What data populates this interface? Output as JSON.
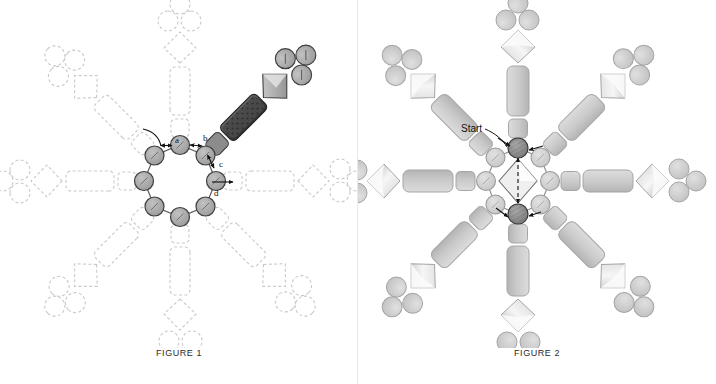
{
  "page": {
    "background": "#ffffff",
    "width": 716,
    "height": 384
  },
  "figures": [
    {
      "id": "figure-1",
      "caption": "FIGURE 1",
      "description": "Octagonal central ring of eight subunits with eight radiating arms; one arm (upper right) is rendered solid/highlighted while the remaining seven are dashed outlines.",
      "center": {
        "x": 180,
        "y": 181
      },
      "ring": {
        "subunit_count": 8,
        "radius": 36,
        "subunit_radius": 9.5,
        "fill": "#a8a8a8",
        "stroke": "#4a4a4a"
      },
      "arm_count": 8,
      "highlighted_arm_index": 1,
      "highlighted_arm_angle_deg": -45,
      "arm_parts": [
        "proximal-segment",
        "rod",
        "diamond-head",
        "triad-circles"
      ],
      "colors": {
        "solid_fill": "#a9a9a9",
        "solid_stroke": "#4d4d4d",
        "dashed_stroke": "#c9c9c9",
        "rod_dark_fill": "#4f4f4f",
        "rod_dark_stroke": "#2e2e2e",
        "diamond_fill": "#b5b5b5",
        "diamond_highlight": "#e2e2e2",
        "circle_fill": "#a6a6a6"
      },
      "labels": [
        {
          "text": "a",
          "x": 177,
          "y": 142
        },
        {
          "text": "b",
          "x": 206,
          "y": 140
        },
        {
          "text": "c",
          "x": 221,
          "y": 164
        },
        {
          "text": "d",
          "x": 216,
          "y": 193
        }
      ],
      "annotations": [
        {
          "name": "curved-rotation-arrow",
          "kind": "curve"
        },
        {
          "name": "arrow-a",
          "kind": "double-arrow"
        },
        {
          "name": "arrow-b",
          "kind": "double-arrow"
        },
        {
          "name": "arrow-c",
          "kind": "double-arrow"
        },
        {
          "name": "arrow-d",
          "kind": "single-arrow"
        }
      ]
    },
    {
      "id": "figure-2",
      "caption": "FIGURE 2",
      "description": "Same eight-fold assembly with all arms rendered solid; the central ring shows a start position and a pair of darker subunits with motion arrows through a central diamond.",
      "center": {
        "x": 518,
        "y": 181
      },
      "ring": {
        "subunit_count": 8,
        "radius": 36,
        "subunit_radius": 9.5,
        "fill": "#cfcfcf",
        "stroke": "#8f8f8f",
        "dark_subunit_fill": "#8a8a8a",
        "dark_subunit_stroke": "#3c3c3c",
        "dark_subunit_indices": [
          0,
          4
        ]
      },
      "arm_count": 8,
      "arm_parts": [
        "proximal-segment",
        "rod",
        "diamond-head",
        "triad-circles"
      ],
      "colors": {
        "solid_fill": "#cccccc",
        "solid_stroke": "#a0a0a0",
        "diamond_fill": "#c4c4c4",
        "diamond_highlight": "#f2f2f2",
        "circle_fill": "#cfcfcf",
        "center_diamond_fill": "#e8e8e8",
        "center_diamond_stroke": "#6d6d6d"
      },
      "labels": [
        {
          "text": "Start",
          "x": 489,
          "y": 130
        }
      ],
      "annotations": [
        {
          "name": "start-leader-line",
          "kind": "leader"
        },
        {
          "name": "arrow-to-start-subunit",
          "kind": "single-arrow"
        },
        {
          "name": "arrow-upper-right",
          "kind": "single-arrow"
        },
        {
          "name": "arrow-lower-left",
          "kind": "single-arrow"
        },
        {
          "name": "arrow-lower-right",
          "kind": "single-arrow"
        },
        {
          "name": "center-vertical-double-arrow",
          "kind": "double-arrow"
        }
      ]
    }
  ]
}
